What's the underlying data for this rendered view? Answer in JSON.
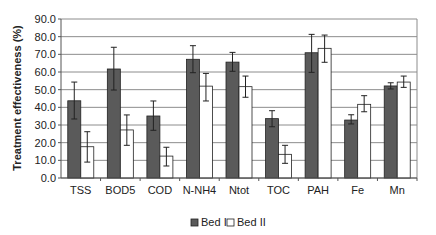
{
  "chart_data": {
    "type": "bar",
    "title": "",
    "xlabel": "",
    "ylabel": "Treatment effectiveness (%)",
    "ylim": [
      0,
      90
    ],
    "yticks": [
      "0.0",
      "10.0",
      "20.0",
      "30.0",
      "40.0",
      "50.0",
      "60.0",
      "70.0",
      "80.0",
      "90.0"
    ],
    "grid": true,
    "legend_position": "bottom",
    "categories": [
      "TSS",
      "BOD5",
      "COD",
      "N-NH4",
      "Ntot",
      "TOC",
      "PAH",
      "Fe",
      "Mn"
    ],
    "series": [
      {
        "name": "Bed I",
        "color": "#5a5a5a",
        "values": [
          43.7,
          61.7,
          35.1,
          67.2,
          65.6,
          33.6,
          70.9,
          32.8,
          52.1
        ],
        "error_high": [
          54.3,
          74.0,
          43.6,
          74.9,
          71.1,
          38.1,
          81.3,
          35.8,
          53.9
        ],
        "error_low": [
          33.4,
          49.8,
          27.0,
          59.6,
          60.4,
          29.0,
          59.8,
          30.6,
          50.4
        ]
      },
      {
        "name": "Bed II",
        "color": "#ffffff",
        "values": [
          17.7,
          27.2,
          12.4,
          52.0,
          51.7,
          13.4,
          73.4,
          41.7,
          54.3
        ],
        "error_high": [
          26.2,
          35.7,
          17.4,
          59.2,
          57.7,
          18.5,
          80.9,
          46.6,
          57.7
        ],
        "error_low": [
          9.0,
          18.5,
          6.8,
          43.6,
          45.7,
          8.3,
          65.5,
          37.5,
          51.3
        ]
      }
    ]
  }
}
